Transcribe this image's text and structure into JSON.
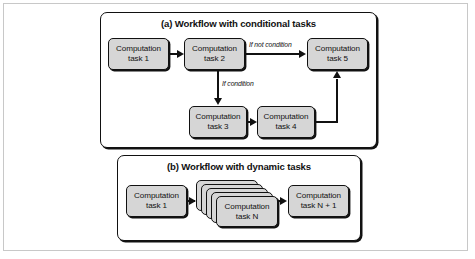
{
  "figure": {
    "panels": [
      {
        "id": "a",
        "title": "(a) Workflow with conditional tasks",
        "nodes": [
          {
            "id": "a1",
            "line1": "Computation",
            "line2": "task 1"
          },
          {
            "id": "a2",
            "line1": "Computation",
            "line2": "task 2"
          },
          {
            "id": "a5",
            "line1": "Computation",
            "line2": "task 5"
          },
          {
            "id": "a3",
            "line1": "Computation",
            "line2": "task 3"
          },
          {
            "id": "a4",
            "line1": "Computation",
            "line2": "task 4"
          }
        ],
        "edge_labels": {
          "if_not_condition": "If not condition",
          "if_condition": "If condition"
        }
      },
      {
        "id": "b",
        "title": "(b) Workflow with dynamic tasks",
        "nodes": [
          {
            "id": "b1",
            "line1": "Computation",
            "line2": "task 1"
          },
          {
            "id": "bN",
            "line1": "Computation",
            "line2": "task N"
          },
          {
            "id": "bN1",
            "line1": "Computation",
            "line2": "task N + 1"
          }
        ],
        "stack_card_count": 5
      }
    ],
    "colors": {
      "node_fill": "#d6d6d6",
      "stroke": "#111111",
      "frame": "#c8c8c8",
      "background": "#ffffff"
    }
  }
}
